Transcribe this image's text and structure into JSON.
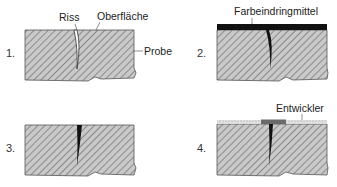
{
  "diagram": {
    "panels": [
      {
        "step": "1.",
        "labels": {
          "crack": "Riss",
          "surface": "Oberfläche",
          "specimen": "Probe"
        }
      },
      {
        "step": "2.",
        "labels": {
          "penetrant": "Farbeindringmittel"
        }
      },
      {
        "step": "3.",
        "labels": {}
      },
      {
        "step": "4.",
        "labels": {
          "developer": "Entwickler"
        }
      }
    ],
    "colors": {
      "specimen_fill": "#c8c8c8",
      "hatch": "#7a7a7a",
      "outline": "#555555",
      "penetrant": "#111111",
      "developer": "#d8d8d8",
      "developer_stain": "#6a6a6a"
    }
  }
}
